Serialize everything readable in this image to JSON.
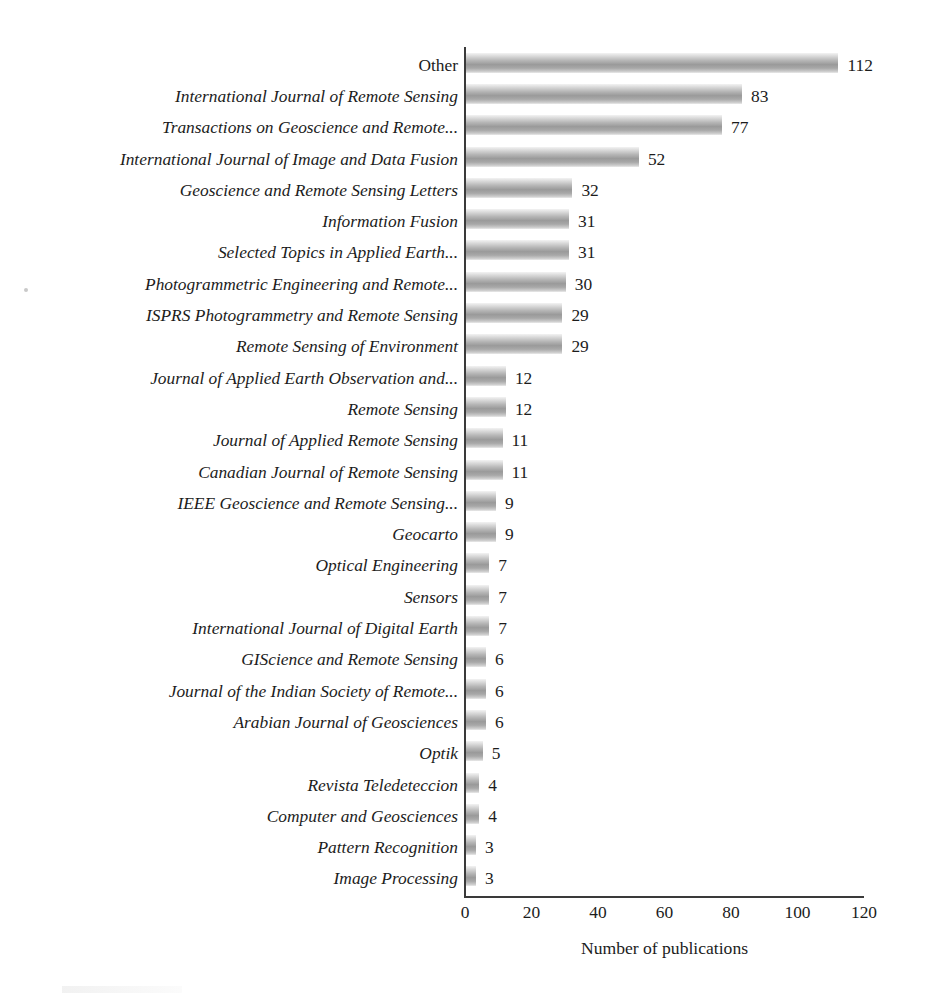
{
  "chart_data": {
    "type": "bar",
    "orientation": "horizontal",
    "title": "",
    "xlabel": "Number of publications",
    "ylabel": "",
    "xlim": [
      0,
      120
    ],
    "xticks": [
      0,
      20,
      40,
      60,
      80,
      100,
      120
    ],
    "grid": false,
    "legend": false,
    "bar_value_labels": true,
    "categories": [
      "Other",
      "International Journal of Remote Sensing",
      "Transactions on Geoscience and Remote...",
      "International Journal of Image and Data Fusion",
      "Geoscience and Remote Sensing Letters",
      "Information Fusion",
      "Selected Topics in Applied Earth...",
      "Photogrammetric Engineering and Remote...",
      "ISPRS Photogrammetry and Remote Sensing",
      "Remote Sensing of Environment",
      "Journal of Applied Earth Observation and...",
      "Remote Sensing",
      "Journal of Applied Remote Sensing",
      "Canadian Journal of Remote Sensing",
      "IEEE Geoscience and Remote Sensing...",
      "Geocarto",
      "Optical Engineering",
      "Sensors",
      "International Journal of Digital Earth",
      "GIScience and Remote Sensing",
      "Journal of the Indian Society of Remote...",
      "Arabian Journal of Geosciences",
      "Optik",
      "Revista Teledeteccion",
      "Computer and Geosciences",
      "Pattern Recognition",
      "Image Processing"
    ],
    "values": [
      112,
      83,
      77,
      52,
      32,
      31,
      31,
      30,
      29,
      29,
      12,
      12,
      11,
      11,
      9,
      9,
      7,
      7,
      7,
      6,
      6,
      6,
      5,
      4,
      4,
      3,
      3
    ],
    "category_styles": [
      "upright",
      "italic",
      "italic",
      "italic",
      "italic",
      "italic",
      "italic",
      "italic",
      "italic",
      "italic",
      "italic",
      "italic",
      "italic",
      "italic",
      "italic",
      "italic",
      "italic",
      "italic",
      "italic",
      "italic",
      "italic",
      "italic",
      "italic",
      "italic",
      "italic",
      "italic",
      "italic"
    ],
    "colors": {
      "bar_light": "#f3f3f3",
      "bar_mid": "#9a9a9a",
      "bar_edge": "#eaeaea",
      "axis": "#3a3a3a",
      "text": "#1c1c1c",
      "background": "#ffffff"
    }
  }
}
